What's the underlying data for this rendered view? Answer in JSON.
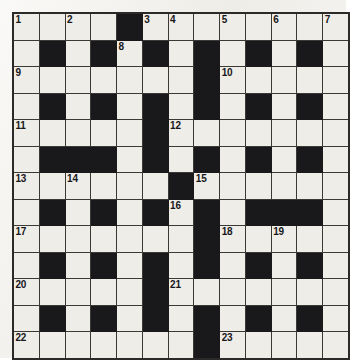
{
  "puzzle": {
    "title": "Crossword Grid",
    "type": "crossword",
    "rows": 13,
    "cols": 13,
    "colors": {
      "paper": "#f3f2ee",
      "cell_white": "#eeede8",
      "cell_black": "#19181a",
      "grid_line": "#3a3936",
      "border": "#2b2a28",
      "number_text": "#18171a"
    },
    "legend": {
      "white_cell": "white-cell",
      "black_cell": "black-cell",
      "numbered_cell": "numbered-cell"
    },
    "clue_numbers": [
      1,
      2,
      3,
      4,
      5,
      6,
      7,
      8,
      9,
      10,
      11,
      12,
      13,
      14,
      15,
      16,
      17,
      18,
      19,
      20,
      21,
      22,
      23
    ],
    "numbered_cells": [
      {
        "number": 1,
        "row": 1,
        "col": 1
      },
      {
        "number": 2,
        "row": 1,
        "col": 3
      },
      {
        "number": 3,
        "row": 1,
        "col": 6
      },
      {
        "number": 4,
        "row": 1,
        "col": 7
      },
      {
        "number": 5,
        "row": 1,
        "col": 9
      },
      {
        "number": 6,
        "row": 1,
        "col": 11
      },
      {
        "number": 7,
        "row": 1,
        "col": 13
      },
      {
        "number": 8,
        "row": 2,
        "col": 5
      },
      {
        "number": 9,
        "row": 3,
        "col": 1
      },
      {
        "number": 10,
        "row": 3,
        "col": 9
      },
      {
        "number": 11,
        "row": 5,
        "col": 1
      },
      {
        "number": 12,
        "row": 5,
        "col": 7
      },
      {
        "number": 13,
        "row": 7,
        "col": 1
      },
      {
        "number": 14,
        "row": 7,
        "col": 3
      },
      {
        "number": 15,
        "row": 7,
        "col": 8
      },
      {
        "number": 16,
        "row": 8,
        "col": 7
      },
      {
        "number": 17,
        "row": 9,
        "col": 1
      },
      {
        "number": 18,
        "row": 9,
        "col": 9
      },
      {
        "number": 19,
        "row": 9,
        "col": 11
      },
      {
        "number": 20,
        "row": 11,
        "col": 1
      },
      {
        "number": 21,
        "row": 11,
        "col": 7
      },
      {
        "number": 22,
        "row": 13,
        "col": 1
      },
      {
        "number": 23,
        "row": 13,
        "col": 9
      }
    ],
    "grid": [
      [
        "W",
        "W",
        "W",
        "W",
        "B",
        "W",
        "W",
        "W",
        "W",
        "W",
        "W",
        "W",
        "W"
      ],
      [
        "W",
        "B",
        "W",
        "B",
        "W",
        "B",
        "W",
        "B",
        "W",
        "B",
        "W",
        "B",
        "W"
      ],
      [
        "W",
        "W",
        "W",
        "W",
        "W",
        "W",
        "W",
        "B",
        "W",
        "W",
        "W",
        "W",
        "W"
      ],
      [
        "W",
        "B",
        "W",
        "B",
        "W",
        "B",
        "W",
        "B",
        "W",
        "B",
        "W",
        "B",
        "W"
      ],
      [
        "W",
        "W",
        "W",
        "W",
        "W",
        "B",
        "W",
        "W",
        "W",
        "W",
        "W",
        "W",
        "W"
      ],
      [
        "W",
        "B",
        "B",
        "B",
        "W",
        "B",
        "W",
        "B",
        "W",
        "B",
        "W",
        "B",
        "W"
      ],
      [
        "W",
        "W",
        "W",
        "W",
        "W",
        "W",
        "B",
        "W",
        "W",
        "W",
        "W",
        "W",
        "W"
      ],
      [
        "W",
        "B",
        "W",
        "B",
        "W",
        "B",
        "W",
        "B",
        "W",
        "B",
        "B",
        "B",
        "W"
      ],
      [
        "W",
        "W",
        "W",
        "W",
        "W",
        "W",
        "W",
        "B",
        "W",
        "W",
        "W",
        "W",
        "W"
      ],
      [
        "W",
        "B",
        "W",
        "B",
        "W",
        "B",
        "W",
        "B",
        "W",
        "B",
        "W",
        "B",
        "W"
      ],
      [
        "W",
        "W",
        "W",
        "W",
        "W",
        "B",
        "W",
        "W",
        "W",
        "W",
        "W",
        "W",
        "W"
      ],
      [
        "W",
        "B",
        "W",
        "B",
        "W",
        "B",
        "W",
        "B",
        "W",
        "B",
        "W",
        "B",
        "W"
      ],
      [
        "W",
        "W",
        "W",
        "W",
        "W",
        "W",
        "W",
        "B",
        "W",
        "W",
        "W",
        "W",
        "W"
      ]
    ]
  }
}
